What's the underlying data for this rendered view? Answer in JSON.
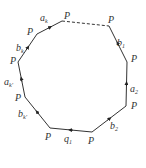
{
  "diagram": {
    "type": "polygon",
    "vertex_label": "P",
    "vertices": [
      {
        "id": "v0",
        "x": 62,
        "y": 21,
        "label": "P",
        "lx": 64,
        "ly": 19
      },
      {
        "id": "v1",
        "x": 109,
        "y": 26,
        "label": "P",
        "lx": 108,
        "ly": 23
      },
      {
        "id": "v2",
        "x": 127,
        "y": 62,
        "label": "P",
        "lx": 131,
        "ly": 62
      },
      {
        "id": "v3",
        "x": 126,
        "y": 106,
        "label": "P",
        "lx": 131,
        "ly": 109
      },
      {
        "id": "v4",
        "x": 92,
        "y": 132,
        "label": "P",
        "lx": 88,
        "ly": 144
      },
      {
        "id": "v5",
        "x": 50,
        "y": 128,
        "label": "P",
        "lx": 45,
        "ly": 140
      },
      {
        "id": "v6",
        "x": 25,
        "y": 97,
        "label": "P",
        "lx": 15,
        "ly": 101
      },
      {
        "id": "v7",
        "x": 18,
        "y": 62,
        "label": "P",
        "lx": 10,
        "ly": 64
      },
      {
        "id": "v8",
        "x": 37,
        "y": 34,
        "label": "P",
        "lx": 27,
        "ly": 35
      }
    ],
    "edges": [
      {
        "from": "v0",
        "to": "v1",
        "style": "dashed",
        "label": ""
      },
      {
        "from": "v1",
        "to": "v2",
        "style": "solid",
        "label": "b",
        "sub": "1",
        "lx": 117,
        "ly": 46
      },
      {
        "from": "v2",
        "to": "v3",
        "style": "solid",
        "label": "a",
        "sub": "2",
        "lx": 130,
        "ly": 92
      },
      {
        "from": "v3",
        "to": "v4",
        "style": "solid",
        "label": "b",
        "sub": "2",
        "lx": 110,
        "ly": 129
      },
      {
        "from": "v4",
        "to": "v5",
        "style": "solid",
        "label": "q",
        "sub": "1",
        "lx": 64,
        "ly": 142
      },
      {
        "from": "v5",
        "to": "v6",
        "style": "solid",
        "label": "b",
        "sub": "k'",
        "lx": 18,
        "ly": 117
      },
      {
        "from": "v6",
        "to": "v7",
        "style": "solid",
        "label": "a",
        "sub": "k'",
        "lx": 4,
        "ly": 85
      },
      {
        "from": "v7",
        "to": "v8",
        "style": "solid",
        "label": "b",
        "sub": "k",
        "lx": 16,
        "ly": 51
      },
      {
        "from": "v8",
        "to": "v0",
        "style": "solid",
        "label": "a",
        "sub": "k",
        "lx": 40,
        "ly": 21
      }
    ],
    "line_color": "#333333"
  }
}
